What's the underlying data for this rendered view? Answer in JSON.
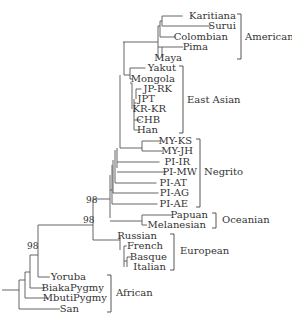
{
  "diagram": {
    "type": "phylogenetic-tree",
    "leaves": [
      {
        "name": "Karitiana",
        "y": 19,
        "x_end": 236,
        "branch_x": 162
      },
      {
        "name": "Surui",
        "y": 29,
        "x_end": 236,
        "branch_x": 211
      },
      {
        "name": "Colombian",
        "y": 40,
        "x_end": 228,
        "branch_x": 160
      },
      {
        "name": "Pima",
        "y": 50,
        "x_end": 208,
        "branch_x": 162
      },
      {
        "name": "Maya",
        "y": 61,
        "x_end": 182,
        "branch_x": 162
      },
      {
        "name": "Yakut",
        "y": 71,
        "x_end": 176,
        "branch_x": 140
      },
      {
        "name": "Mongola",
        "y": 82,
        "x_end": 175,
        "branch_x": 130
      },
      {
        "name": "JP-RK",
        "y": 92,
        "x_end": 172,
        "branch_x": 140
      },
      {
        "name": "JPT",
        "y": 102,
        "x_end": 155,
        "branch_x": 136
      },
      {
        "name": "KR-KR",
        "y": 112,
        "x_end": 166,
        "branch_x": 135
      },
      {
        "name": "CHB",
        "y": 123,
        "x_end": 160,
        "branch_x": 134
      },
      {
        "name": "Han",
        "y": 133,
        "x_end": 158,
        "branch_x": 134
      },
      {
        "name": "MY-KS",
        "y": 144,
        "x_end": 192,
        "branch_x": 142
      },
      {
        "name": "MY-JH",
        "y": 154,
        "x_end": 193,
        "branch_x": 142
      },
      {
        "name": "PI-IR",
        "y": 165,
        "x_end": 190,
        "branch_x": 117
      },
      {
        "name": "PI-MW",
        "y": 175,
        "x_end": 197,
        "branch_x": 117
      },
      {
        "name": "PI-AT",
        "y": 186,
        "x_end": 187,
        "branch_x": 118
      },
      {
        "name": "PI-AG",
        "y": 196,
        "x_end": 189,
        "branch_x": 114
      },
      {
        "name": "PI-AE",
        "y": 207,
        "x_end": 188,
        "branch_x": 112
      },
      {
        "name": "Papuan",
        "y": 218,
        "x_end": 208,
        "branch_x": 142
      },
      {
        "name": "Melanesian",
        "y": 228,
        "x_end": 206,
        "branch_x": 142
      },
      {
        "name": "Russian",
        "y": 239,
        "x_end": 157,
        "branch_x": 120
      },
      {
        "name": "French",
        "y": 249,
        "x_end": 163,
        "branch_x": 124
      },
      {
        "name": "Basque",
        "y": 260,
        "x_end": 167,
        "branch_x": 127
      },
      {
        "name": "Italian",
        "y": 270,
        "x_end": 166,
        "branch_x": 127
      },
      {
        "name": "Yoruba",
        "y": 280,
        "x_end": 86,
        "branch_x": 38
      },
      {
        "name": "BiakaPygmy",
        "y": 291,
        "x_end": 104,
        "branch_x": 30
      },
      {
        "name": "MbutiPygmy",
        "y": 301,
        "x_end": 107,
        "branch_x": 25
      },
      {
        "name": "San",
        "y": 312,
        "x_end": 79,
        "branch_x": 19
      }
    ],
    "groups": [
      {
        "label": "American",
        "y_top": 14,
        "y_bottom": 59,
        "bracket_x": 241,
        "label_x": 245,
        "label_y": 40
      },
      {
        "label": "East Asian",
        "y_top": 66,
        "y_bottom": 133,
        "bracket_x": 183,
        "label_x": 187,
        "label_y": 103
      },
      {
        "label": "Negrito",
        "y_top": 139,
        "y_bottom": 207,
        "bracket_x": 200,
        "label_x": 204,
        "label_y": 175
      },
      {
        "label": "Oceanian",
        "y_top": 213,
        "y_bottom": 228,
        "bracket_x": 216,
        "label_x": 222,
        "label_y": 223
      },
      {
        "label": "European",
        "y_top": 234,
        "y_bottom": 270,
        "bracket_x": 174,
        "label_x": 180,
        "label_y": 254
      },
      {
        "label": "African",
        "y_top": 275,
        "y_bottom": 312,
        "bracket_x": 111,
        "label_x": 116,
        "label_y": 296
      }
    ],
    "bootstrap": [
      {
        "value": "98",
        "x": 86,
        "y": 203
      },
      {
        "value": "98",
        "x": 83,
        "y": 223
      },
      {
        "value": "98",
        "x": 27,
        "y": 249
      }
    ]
  }
}
